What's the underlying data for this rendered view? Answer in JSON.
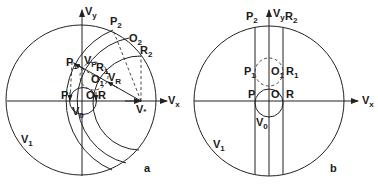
{
  "panels": [
    {
      "id": "a",
      "caption": "a",
      "axes": {
        "x_label": "V",
        "x_sub": "x",
        "y_label": "V",
        "y_sub": "y"
      },
      "labels": {
        "outer_circle": {
          "main": "V",
          "sub": "1"
        },
        "inner_circle": {
          "main": "V",
          "sub": "0"
        },
        "origin": "O",
        "P": "P",
        "R": "R",
        "P1": {
          "main": "P",
          "sub": "1"
        },
        "R1": {
          "main": "R",
          "sub": "1"
        },
        "O1": {
          "main": "O",
          "sub": "1"
        },
        "P2": {
          "main": "P",
          "sub": "2"
        },
        "R2": {
          "main": "R",
          "sub": "2"
        },
        "O2": {
          "main": "O",
          "sub": "2"
        },
        "vP": {
          "main": "V",
          "sub": "P"
        },
        "vR": {
          "main": "V",
          "sub": "R"
        },
        "vstar": {
          "main": "V",
          "sub": "*"
        }
      }
    },
    {
      "id": "b",
      "caption": "b",
      "axes": {
        "x_label": "V",
        "x_sub": "x",
        "y_label": "V",
        "y_sub": "y"
      },
      "labels": {
        "outer_circle": {
          "main": "V",
          "sub": "1"
        },
        "inner_circle": {
          "main": "V",
          "sub": "0"
        },
        "origin": "O",
        "P": "P",
        "R": "R",
        "P1": {
          "main": "P",
          "sub": "1"
        },
        "R1": {
          "main": "R",
          "sub": "1"
        },
        "O1": {
          "main": "O",
          "sub": "1"
        },
        "P2": {
          "main": "P",
          "sub": "2"
        },
        "R2": {
          "main": "R",
          "sub": "2"
        }
      }
    }
  ],
  "colors": {
    "ink": "#222222",
    "background": "#ffffff"
  }
}
